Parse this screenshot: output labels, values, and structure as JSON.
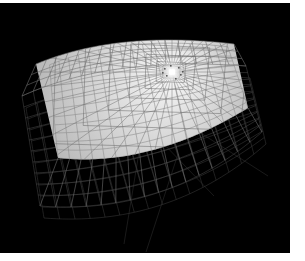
{
  "figure": {
    "title": "3D wireframe mesh surface rendering",
    "caption": "Perspective view of a curved fan-shaped quadrilateral mesh with an illuminated upper surface and a dark lower wireframe shell, with radial grid lines converging toward a bright focal highlight.",
    "domain": "scientific-visualization",
    "render_style": "wireframe-and-shaded-surface",
    "background_color": "#000000",
    "page_margin_color": "#ffffff"
  },
  "canvas": {
    "width": 305,
    "height": 261,
    "plot_rect": {
      "x": 0,
      "y": 3,
      "width": 290,
      "height": 250
    },
    "margin_right_px": 15,
    "margin_bottom_px": 8,
    "margin_top_px": 3
  },
  "colors": {
    "background": "#000000",
    "surface_bright": "#ededed",
    "surface_mid": "#c9c9c9",
    "surface_shadow": "#8a8a8a",
    "grid_on_surface": "#8e8e8e",
    "grid_dark_wire": "#6e6e6e",
    "grid_faint_wire": "#3a3a3a",
    "highlight_core": "#ffffff",
    "paper_white": "#ffffff"
  },
  "geometry": {
    "focal_point": {
      "x": 172,
      "y": 72,
      "label": "bright-center-highlight"
    },
    "surface": {
      "name": "upper-illuminated-sheet",
      "shape": "curved-sector",
      "corners_px": [
        {
          "x": 36,
          "y": 64
        },
        {
          "x": 118,
          "y": 30
        },
        {
          "x": 234,
          "y": 44
        },
        {
          "x": 248,
          "y": 108
        },
        {
          "x": 150,
          "y": 168
        },
        {
          "x": 58,
          "y": 158
        }
      ],
      "u_divisions": 16,
      "v_divisions": 12
    },
    "lower_shell": {
      "name": "lower-dark-wireframe",
      "corners_px": [
        {
          "x": 22,
          "y": 96
        },
        {
          "x": 110,
          "y": 56
        },
        {
          "x": 246,
          "y": 66
        },
        {
          "x": 262,
          "y": 132
        },
        {
          "x": 166,
          "y": 216
        },
        {
          "x": 40,
          "y": 206
        }
      ],
      "u_divisions": 16,
      "v_divisions": 10
    },
    "radial_spokes": 40,
    "concentric_rings": 9,
    "stray_rays": [
      {
        "x1": 196,
        "y1": 130,
        "x2": 268,
        "y2": 176
      },
      {
        "x1": 140,
        "y1": 146,
        "x2": 124,
        "y2": 244
      },
      {
        "x1": 178,
        "y1": 154,
        "x2": 146,
        "y2": 252
      },
      {
        "x1": 160,
        "y1": 140,
        "x2": 214,
        "y2": 196
      }
    ]
  },
  "chart_data": {
    "type": "surface",
    "title": "3D wireframe mesh surface rendering",
    "xlabel": "",
    "ylabel": "",
    "zlabel": "",
    "grid": true,
    "legend": "none"
  }
}
